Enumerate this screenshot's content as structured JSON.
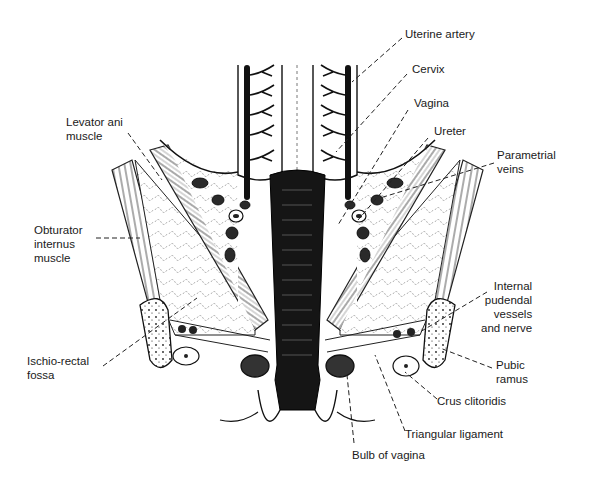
{
  "figure": {
    "labels": [
      {
        "id": "uterine-artery",
        "text": "Uterine artery",
        "x": 405,
        "y": 33,
        "align": "left",
        "line": [
          [
            402,
            38
          ],
          [
            352,
            82
          ]
        ]
      },
      {
        "id": "cervix",
        "text": "Cervix",
        "x": 412,
        "y": 68,
        "align": "left",
        "line": [
          [
            407,
            74
          ],
          [
            336,
            152
          ]
        ]
      },
      {
        "id": "vagina",
        "text": "Vagina",
        "x": 414,
        "y": 102,
        "align": "left",
        "line": [
          [
            408,
            110
          ],
          [
            338,
            225
          ]
        ]
      },
      {
        "id": "ureter",
        "text": "Ureter",
        "x": 434,
        "y": 130,
        "align": "left",
        "line": [
          [
            428,
            138
          ],
          [
            358,
            220
          ]
        ]
      },
      {
        "id": "parametrial-veins",
        "text": "Parametrial\nveins",
        "x": 497,
        "y": 154,
        "align": "left",
        "line": [
          [
            494,
            163
          ],
          [
            380,
            198
          ]
        ]
      },
      {
        "id": "levator-ani-muscle",
        "text": "Levator ani\nmuscle",
        "x": 66,
        "y": 121,
        "align": "left",
        "line": [
          [
            128,
            133
          ],
          [
            162,
            180
          ]
        ]
      },
      {
        "id": "obturator-internus-muscle",
        "text": "Obturator\ninternus\nmuscle",
        "x": 34,
        "y": 229,
        "align": "left",
        "line": [
          [
            96,
            238
          ],
          [
            140,
            238
          ]
        ]
      },
      {
        "id": "ischio-rectal-fossa",
        "text": "Ischio-rectal\nfossa",
        "x": 27,
        "y": 360,
        "align": "left",
        "line": [
          [
            103,
            366
          ],
          [
            197,
            298
          ]
        ]
      },
      {
        "id": "internal-pudendal-vessels-and-nerve",
        "text": "Internal\npudendal\nvessels\nand nerve",
        "x": 481,
        "y": 285,
        "align": "right",
        "line": [
          [
            487,
            292
          ],
          [
            420,
            332
          ]
        ]
      },
      {
        "id": "pubic-ramus",
        "text": "Pubic\nramus",
        "x": 496,
        "y": 364,
        "align": "left",
        "line": [
          [
            492,
            368
          ],
          [
            440,
            348
          ]
        ]
      },
      {
        "id": "crus-clitoridis",
        "text": "Crus clitoridis",
        "x": 437,
        "y": 400,
        "align": "left",
        "line": [
          [
            437,
            399
          ],
          [
            405,
            372
          ]
        ]
      },
      {
        "id": "triangular-ligament",
        "text": "Triangular ligament",
        "x": 405,
        "y": 433,
        "align": "left",
        "line": [
          [
            405,
            431
          ],
          [
            375,
            355
          ]
        ]
      },
      {
        "id": "bulb-of-vagina",
        "text": "Bulb of vagina",
        "x": 352,
        "y": 454,
        "align": "left",
        "line": [
          [
            354,
            443
          ],
          [
            347,
            375
          ]
        ]
      }
    ]
  },
  "colors": {
    "ink": "#1a1a1a",
    "paper": "#ffffff",
    "fat": "#f4f4f4",
    "muscle": "#9a9a9a"
  }
}
